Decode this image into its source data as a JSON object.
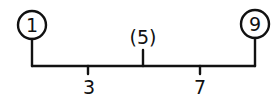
{
  "diagram": {
    "type": "tree",
    "root_edge": {
      "left_leaf": "1",
      "right_leaf": "9",
      "middle_label": "(5)"
    },
    "nodes": [
      {
        "id": "left-leaf",
        "label": "1",
        "circled": true
      },
      {
        "id": "right-leaf",
        "label": "9",
        "circled": true
      },
      {
        "id": "middle",
        "label": "(5)",
        "circled": false
      }
    ],
    "branch_labels": [
      {
        "id": "left-branch",
        "label": "3"
      },
      {
        "id": "right-branch",
        "label": "7"
      }
    ],
    "colors": {
      "ink": "#111111",
      "background": "#ffffff"
    }
  }
}
